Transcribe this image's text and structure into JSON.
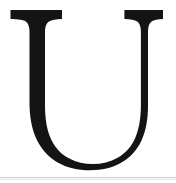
{
  "plate": {
    "kind": "glyph-specimen",
    "character": "U",
    "character_name": "Latin Capital Letter U",
    "case": "uppercase",
    "typeface_style": "serif",
    "alt_text": "Large black serif capital letter U on a white background",
    "background_color": "#ffffff",
    "ink_color": "#141414",
    "scan_line_color": "#c9c9c9",
    "width": 176,
    "height": 183
  },
  "geometry": {
    "left_serif": {
      "x_start": 10,
      "x_end": 62,
      "y_top": 10,
      "y_bottom": 20
    },
    "right_serif": {
      "x_start": 117,
      "x_end": 163,
      "y_top": 10,
      "y_bottom": 20
    },
    "left_stem": {
      "x_start": 22,
      "x_end": 43,
      "width": 21
    },
    "right_stem": {
      "x_start": 137,
      "x_end": 150,
      "width": 13
    },
    "bowl": {
      "bottom_y": 170,
      "center_x": 88
    },
    "scan_rule_y": 177
  }
}
